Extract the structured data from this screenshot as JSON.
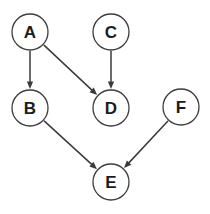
{
  "diagram": {
    "type": "directed-graph",
    "background_color": "#ffffff",
    "node_fill_color": "#ffffff",
    "node_stroke_color": "#3d3d3d",
    "edge_color": "#3a3a3a",
    "label_color": "#1c1c1c",
    "node_radius": 18,
    "nodes": [
      {
        "id": "A",
        "label": "A",
        "cx": 30,
        "cy": 32
      },
      {
        "id": "C",
        "label": "C",
        "cx": 111,
        "cy": 32
      },
      {
        "id": "B",
        "label": "B",
        "cx": 30,
        "cy": 108
      },
      {
        "id": "D",
        "label": "D",
        "cx": 111,
        "cy": 108
      },
      {
        "id": "F",
        "label": "F",
        "cx": 181,
        "cy": 107
      },
      {
        "id": "E",
        "label": "E",
        "cx": 111,
        "cy": 182
      }
    ],
    "edges": [
      {
        "id": "A-B",
        "from": "A",
        "to": "B",
        "label": "",
        "directed": true
      },
      {
        "id": "A-D",
        "from": "A",
        "to": "D",
        "label": "",
        "directed": true
      },
      {
        "id": "C-D",
        "from": "C",
        "to": "D",
        "label": "",
        "directed": true
      },
      {
        "id": "B-E",
        "from": "B",
        "to": "E",
        "label": "",
        "directed": true
      },
      {
        "id": "F-E",
        "from": "F",
        "to": "E",
        "label": "",
        "directed": true
      }
    ]
  }
}
